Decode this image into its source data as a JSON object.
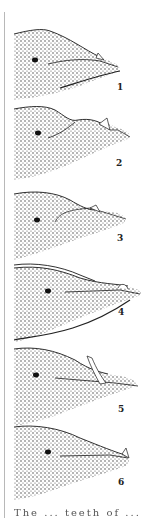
{
  "figure": {
    "panels": [
      {
        "label": "1",
        "tooth": "triangular tooth at mid-jaw, erupted"
      },
      {
        "label": "2",
        "tooth": "triangular tooth further forward on raised jaw"
      },
      {
        "label": "3",
        "tooth": "small tooth near jaw tip"
      },
      {
        "label": "4",
        "tooth": "rounded tooth near jaw tip"
      },
      {
        "label": "5",
        "tooth": "long strap-like tooth curving upward"
      },
      {
        "label": "6",
        "tooth": "small tooth at jaw tip"
      }
    ],
    "caption_fragment": "The ... teeth of ..."
  },
  "colors": {
    "ink": "#1a1a1a",
    "stipple": "#3a3a3a",
    "paper": "#ffffff",
    "border": "#b8b8b8"
  }
}
